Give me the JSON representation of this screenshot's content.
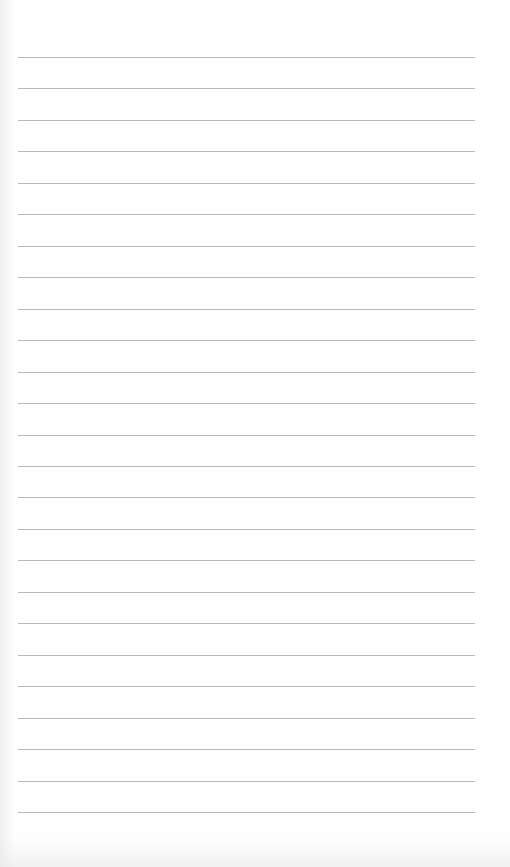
{
  "page": {
    "type": "lined-paper",
    "background_color": "#fefefe",
    "rule_color": "#b9b9b9",
    "rule_count": 25,
    "first_rule_y": 57,
    "rule_spacing": 31.46,
    "rule_left": 18,
    "rule_right": 475
  }
}
